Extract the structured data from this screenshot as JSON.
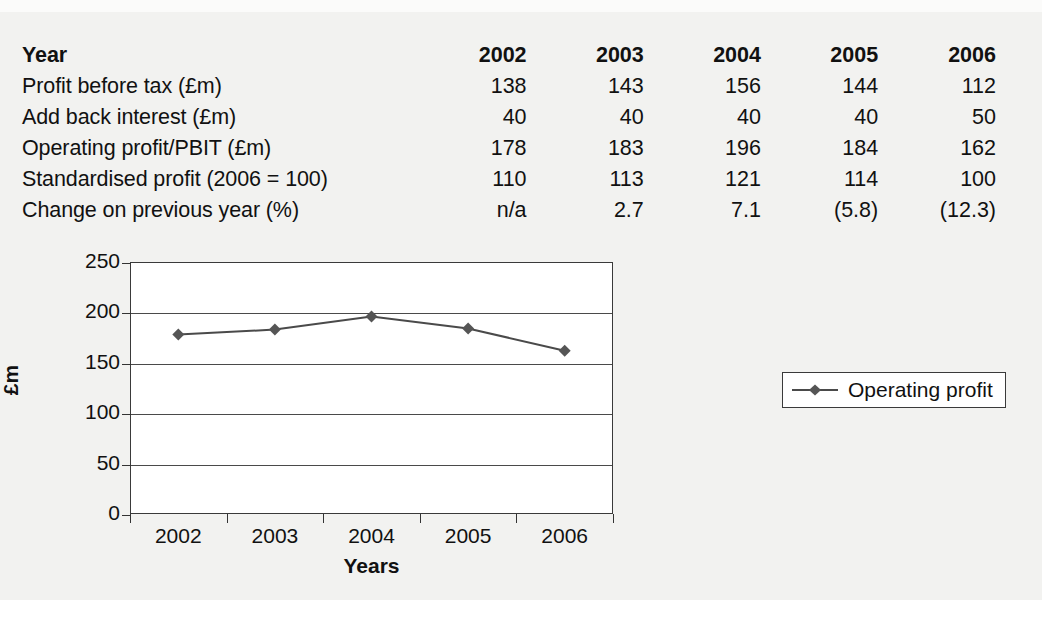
{
  "table": {
    "rows": [
      {
        "label": "Year",
        "values": [
          "2002",
          "2003",
          "2004",
          "2005",
          "2006"
        ],
        "header": true
      },
      {
        "label": "Profit before tax (£m)",
        "values": [
          "138",
          "143",
          "156",
          "144",
          "112"
        ],
        "header": false
      },
      {
        "label": "Add back interest (£m)",
        "values": [
          "40",
          "40",
          "40",
          "40",
          "50"
        ],
        "header": false
      },
      {
        "label": "Operating profit/PBIT (£m)",
        "values": [
          "178",
          "183",
          "196",
          "184",
          "162"
        ],
        "header": false
      },
      {
        "label": "Standardised profit (2006 = 100)",
        "values": [
          "110",
          "113",
          "121",
          "114",
          "100"
        ],
        "header": false
      },
      {
        "label": "Change on previous year (%)",
        "values": [
          "n/a",
          "2.7",
          "7.1",
          "(5.8)",
          "(12.3)"
        ],
        "header": false
      }
    ]
  },
  "chart_data": {
    "type": "line",
    "title": "",
    "xlabel": "Years",
    "ylabel": "£m",
    "categories": [
      "2002",
      "2003",
      "2004",
      "2005",
      "2006"
    ],
    "series": [
      {
        "name": "Operating profit",
        "values": [
          178,
          183,
          196,
          184,
          162
        ]
      }
    ],
    "ylim": [
      0,
      250
    ],
    "yticks": [
      0,
      50,
      100,
      150,
      200,
      250
    ],
    "ytick_labels": [
      "0",
      "50",
      "100",
      "150",
      "200",
      "250"
    ],
    "grid": true,
    "legend_position": "right",
    "marker": "diamond",
    "line_color": "#4a4a4a",
    "marker_color": "#555555"
  }
}
